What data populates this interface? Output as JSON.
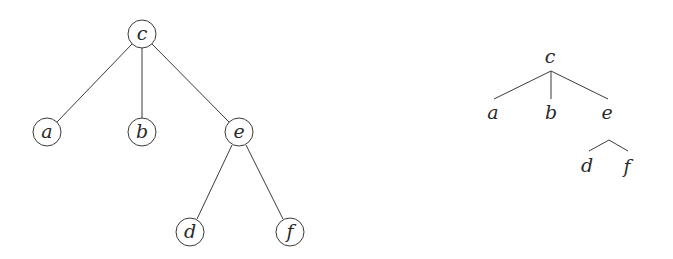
{
  "left_tree": {
    "style": "circled-nodes",
    "nodes": [
      {
        "id": "c",
        "label": "c",
        "x": 142,
        "y": 34
      },
      {
        "id": "a",
        "label": "a",
        "x": 47,
        "y": 132
      },
      {
        "id": "b",
        "label": "b",
        "x": 142,
        "y": 132
      },
      {
        "id": "e",
        "label": "e",
        "x": 239,
        "y": 132
      },
      {
        "id": "d",
        "label": "d",
        "x": 190,
        "y": 232
      },
      {
        "id": "f",
        "label": "f",
        "x": 290,
        "y": 232
      }
    ],
    "edges": [
      [
        "c",
        "a"
      ],
      [
        "c",
        "b"
      ],
      [
        "c",
        "e"
      ],
      [
        "e",
        "d"
      ],
      [
        "e",
        "f"
      ]
    ]
  },
  "right_tree": {
    "style": "plain-labels",
    "nodes": [
      {
        "id": "c",
        "label": "c",
        "x": 550,
        "y": 56
      },
      {
        "id": "a",
        "label": "a",
        "x": 493,
        "y": 112
      },
      {
        "id": "b",
        "label": "b",
        "x": 551,
        "y": 112
      },
      {
        "id": "e",
        "label": "e",
        "x": 607,
        "y": 112
      },
      {
        "id": "d",
        "label": "d",
        "x": 587,
        "y": 165
      },
      {
        "id": "f",
        "label": "f",
        "x": 627,
        "y": 166
      }
    ],
    "edges": [
      [
        "c",
        "a"
      ],
      [
        "c",
        "b"
      ],
      [
        "c",
        "e"
      ],
      [
        "e",
        "d"
      ],
      [
        "e",
        "f"
      ]
    ]
  }
}
